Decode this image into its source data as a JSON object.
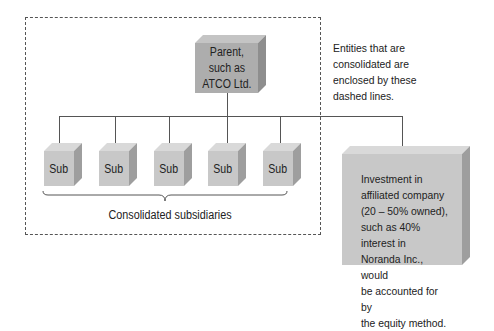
{
  "parent": {
    "label_lines": [
      "Parent,",
      "such as",
      "ATCO Ltd."
    ]
  },
  "subsidiaries": [
    {
      "label": "Sub"
    },
    {
      "label": "Sub"
    },
    {
      "label": "Sub"
    },
    {
      "label": "Sub"
    },
    {
      "label": "Sub"
    }
  ],
  "brace_label": "Consolidated subsidiaries",
  "note": {
    "lines": [
      "Entities that are",
      "consolidated are",
      "enclosed by these",
      "dashed lines."
    ]
  },
  "investment": {
    "lines": [
      "Investment in",
      "affiliated company",
      "(20 – 50% owned),",
      "such as 40% interest in",
      "Noranda Inc., would",
      "be accounted for by",
      "the equity method."
    ]
  },
  "colors": {
    "cube_front": "#c8c8c8",
    "parent_front": "#adadad",
    "cube_side": "#9e9e9e",
    "cube_top": "#d9d9d9",
    "lines": "#555555"
  }
}
